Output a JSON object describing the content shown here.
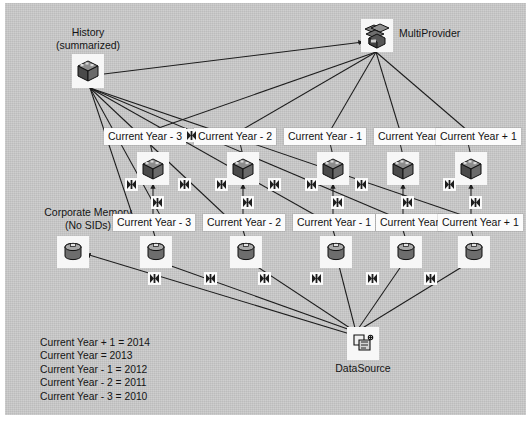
{
  "diagram": {
    "title_nodes": {
      "history": {
        "line1": "History",
        "line2": "(summarized)",
        "icon": "cube-icon"
      },
      "multiprovider": {
        "label": "MultiProvider",
        "icon": "multiprovider-icon"
      },
      "corporate_memory": {
        "line1": "Corporate Memory",
        "line2": "(No SIDs)",
        "icon": "dso-cylinder-icon"
      },
      "datasource": {
        "label": "DataSource",
        "icon": "datasource-icon"
      }
    },
    "cube_row": [
      {
        "label": "Current Year - 3",
        "icon": "cube-icon"
      },
      {
        "label": "Current Year - 2",
        "icon": "cube-icon"
      },
      {
        "label": "Current Year - 1",
        "icon": "cube-icon"
      },
      {
        "label": "Current Year",
        "icon": "cube-icon"
      },
      {
        "label": "Current Year + 1",
        "icon": "cube-icon"
      }
    ],
    "dso_row": [
      {
        "label": "Current Year - 3",
        "icon": "dso-cylinder-icon"
      },
      {
        "label": "Current Year - 2",
        "icon": "dso-cylinder-icon"
      },
      {
        "label": "Current Year - 1",
        "icon": "dso-cylinder-icon"
      },
      {
        "label": "Current Year",
        "icon": "dso-cylinder-icon"
      },
      {
        "label": "Current Year + 1",
        "icon": "dso-cylinder-icon"
      }
    ],
    "transformation_marker": "transformation-icon",
    "legend": [
      "Current Year + 1 = 2014",
      "Current Year = 2013",
      "Current Year - 1 = 2012",
      "Current Year - 2 = 2011",
      "Current Year - 3 = 2010"
    ],
    "colors": {
      "canvas": "#c9c9c9",
      "label_box": "#fbfbfb",
      "line": "#1d1d1d",
      "text": "#141414"
    }
  }
}
